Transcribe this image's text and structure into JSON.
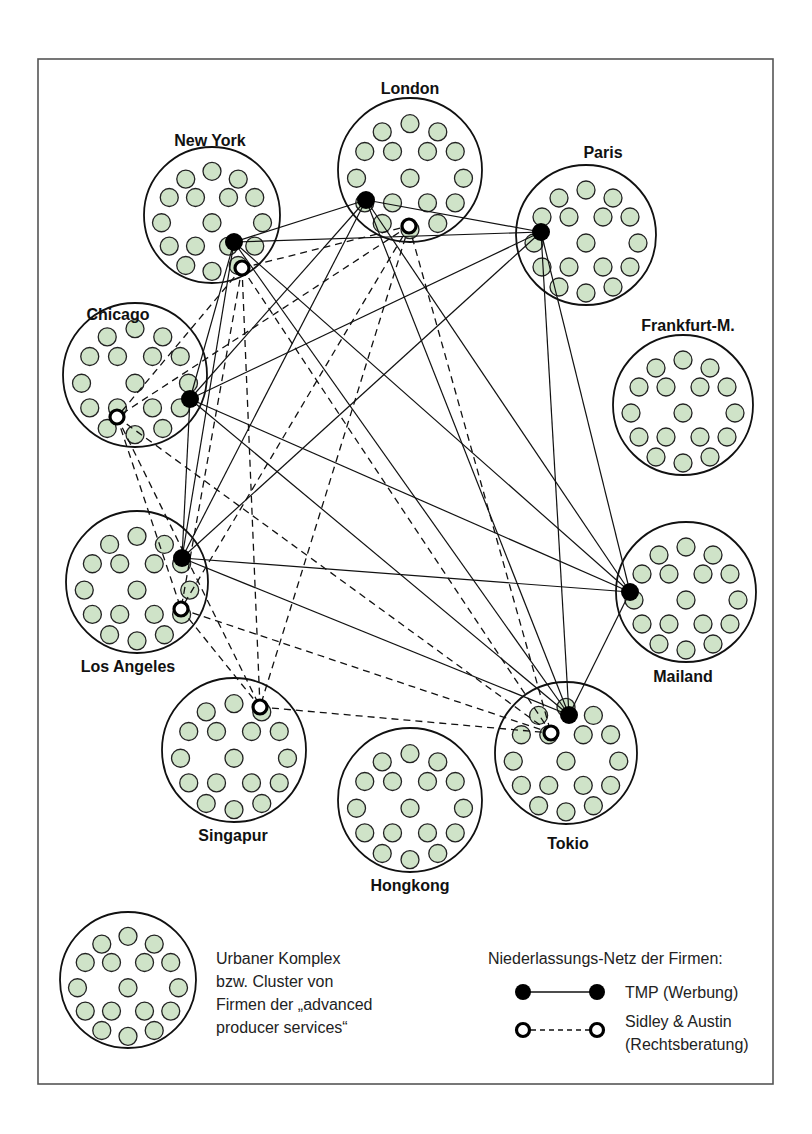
{
  "figure": {
    "width": 812,
    "height": 1134,
    "frame": {
      "x": 38,
      "y": 59,
      "width": 735,
      "height": 1025
    }
  },
  "colors": {
    "firm_fill": "#cfe3c8",
    "firm_stroke": "#222222",
    "cluster_stroke": "#111111",
    "tmp_hub": "#000000",
    "sa_hub_stroke": "#000000",
    "background": "#ffffff"
  },
  "firm_pattern": {
    "radius": 9,
    "offsets": [
      [
        0,
        -45
      ],
      [
        -27,
        -37
      ],
      [
        27,
        -37
      ],
      [
        -44,
        -18
      ],
      [
        44,
        -18
      ],
      [
        -17,
        -18
      ],
      [
        17,
        -18
      ],
      [
        -52,
        8
      ],
      [
        0,
        8
      ],
      [
        52,
        8
      ],
      [
        -17,
        32
      ],
      [
        17,
        32
      ],
      [
        -44,
        32
      ],
      [
        44,
        32
      ],
      [
        -27,
        52
      ],
      [
        0,
        58
      ],
      [
        27,
        52
      ]
    ]
  },
  "cities": [
    {
      "id": "new-york",
      "label": "New York",
      "cx": 212,
      "cy": 215,
      "r": 68,
      "lx": 210,
      "ly": 146,
      "anchor": "middle",
      "tmp": [
        234,
        242
      ],
      "sa": [
        242,
        268
      ]
    },
    {
      "id": "london",
      "label": "London",
      "cx": 410,
      "cy": 170,
      "r": 72,
      "lx": 410,
      "ly": 94,
      "anchor": "middle",
      "tmp": [
        366,
        200
      ],
      "sa": [
        409,
        226
      ]
    },
    {
      "id": "paris",
      "label": "Paris",
      "cx": 586,
      "cy": 235,
      "r": 70,
      "lx": 603,
      "ly": 158,
      "anchor": "middle",
      "tmp": [
        541,
        232
      ],
      "sa": null
    },
    {
      "id": "frankfurt",
      "label": "Frankfurt-M.",
      "cx": 683,
      "cy": 405,
      "r": 70,
      "lx": 688,
      "ly": 331,
      "anchor": "middle",
      "tmp": null,
      "sa": null
    },
    {
      "id": "chicago",
      "label": "Chicago",
      "cx": 135,
      "cy": 375,
      "r": 72,
      "lx": 118,
      "ly": 320,
      "anchor": "middle",
      "tmp": [
        190,
        399
      ],
      "sa": [
        117,
        417
      ]
    },
    {
      "id": "los-angeles",
      "label": "Los Angeles",
      "cx": 137,
      "cy": 582,
      "r": 71,
      "lx": 128,
      "ly": 672,
      "anchor": "middle",
      "tmp": [
        182,
        558
      ],
      "sa": [
        181,
        609
      ]
    },
    {
      "id": "mailand",
      "label": "Mailand",
      "cx": 686,
      "cy": 592,
      "r": 70,
      "lx": 683,
      "ly": 682,
      "anchor": "middle",
      "tmp": [
        630,
        592
      ],
      "sa": null
    },
    {
      "id": "singapur",
      "label": "Singapur",
      "cx": 234,
      "cy": 750,
      "r": 72,
      "lx": 233,
      "ly": 841,
      "anchor": "middle",
      "tmp": null,
      "sa": [
        260,
        707
      ]
    },
    {
      "id": "hongkong",
      "label": "Hongkong",
      "cx": 410,
      "cy": 800,
      "r": 72,
      "lx": 410,
      "ly": 891,
      "anchor": "middle",
      "tmp": null,
      "sa": null
    },
    {
      "id": "tokio",
      "label": "Tokio",
      "cx": 566,
      "cy": 753,
      "r": 71,
      "lx": 568,
      "ly": 849,
      "anchor": "middle",
      "tmp": [
        569,
        715
      ],
      "sa": [
        551,
        733
      ]
    }
  ],
  "networks": {
    "tmp": {
      "name": "TMP (Werbung)",
      "style": "solid",
      "nodes": [
        "new-york",
        "london",
        "paris",
        "chicago",
        "los-angeles",
        "mailand",
        "tokio"
      ],
      "topology": "complete"
    },
    "sidley_austin": {
      "name": "Sidley & Austin (Rechtsberatung)",
      "style": "dashed",
      "nodes": [
        "new-york",
        "london",
        "chicago",
        "los-angeles",
        "singapur",
        "tokio"
      ],
      "topology": "complete"
    }
  },
  "legend": {
    "cluster": {
      "cx": 128,
      "cy": 980,
      "r": 68
    },
    "cluster_text": [
      "Urbaner Komplex",
      "bzw. Cluster von",
      "Firmen der „advanced",
      "producer services“"
    ],
    "network_title": "Niederlassungs-Netz der Firmen:",
    "tmp_label": "TMP (Werbung)",
    "sa_label_line1": "Sidley & Austin",
    "sa_label_line2": "(Rechtsberatung)"
  }
}
